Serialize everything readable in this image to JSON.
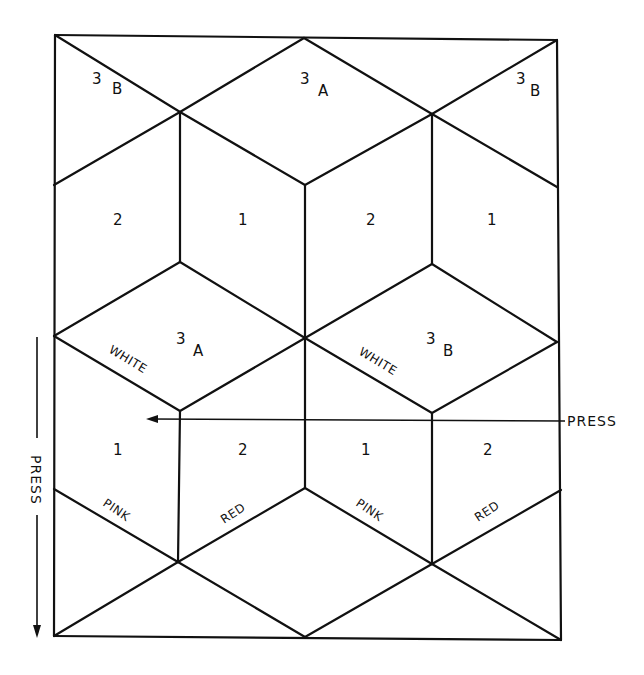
{
  "diagram": {
    "rows": [
      {
        "row": "top-triangles",
        "cells": [
          {
            "num": "3",
            "sub": "B"
          },
          {
            "num": "3",
            "sub": "A"
          },
          {
            "num": "3",
            "sub": "B"
          }
        ]
      },
      {
        "row": "upper-sides",
        "cells": [
          {
            "num": "2"
          },
          {
            "num": "1"
          },
          {
            "num": "2"
          },
          {
            "num": "1"
          }
        ]
      },
      {
        "row": "middle-tops",
        "cells": [
          {
            "num": "3",
            "sub": "A",
            "edge_label": "WHITE"
          },
          {
            "num": "3",
            "sub": "B",
            "edge_label": "WHITE"
          }
        ]
      },
      {
        "row": "lower-sides",
        "cells": [
          {
            "num": "1",
            "edge_label": "PINK"
          },
          {
            "num": "2",
            "edge_label": "RED"
          },
          {
            "num": "1",
            "edge_label": "PINK"
          },
          {
            "num": "2",
            "edge_label": "RED"
          }
        ]
      }
    ],
    "annotations": {
      "press_horizontal": "PRESS",
      "press_vertical": "PRESS"
    }
  }
}
